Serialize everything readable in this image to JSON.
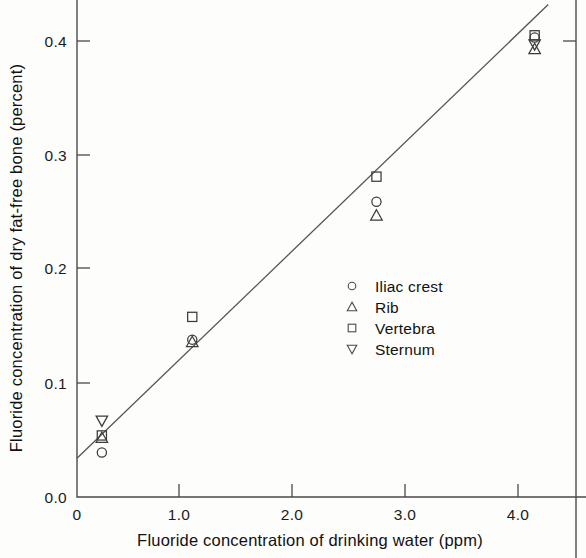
{
  "chart_data": {
    "type": "scatter",
    "title": "",
    "xlabel": "Fluoride concentration of drinking water (ppm)",
    "ylabel": "Fluoride concentration of dry fat-free bone (percent)",
    "xlim": [
      0.0,
      4.4
    ],
    "ylim": [
      0.0,
      0.44
    ],
    "xticks": [
      0,
      1.0,
      2.0,
      3.0,
      4.0
    ],
    "xtick_labels": [
      "0",
      "1.0",
      "2.0",
      "3.0",
      "4.0"
    ],
    "yticks": [
      0.0,
      0.1,
      0.2,
      0.3,
      0.4
    ],
    "ytick_labels": [
      "0.0",
      "0.1",
      "0.2",
      "0.3",
      "0.4"
    ],
    "grid": false,
    "legend_position": "center-right",
    "series": [
      {
        "name": "Iliac crest",
        "marker": "circle",
        "points": [
          {
            "x": 0.22,
            "y": 0.039
          },
          {
            "x": 1.02,
            "y": 0.138
          },
          {
            "x": 2.65,
            "y": 0.259
          },
          {
            "x": 4.05,
            "y": 0.403
          }
        ]
      },
      {
        "name": "Rib",
        "marker": "triangle-up",
        "points": [
          {
            "x": 0.22,
            "y": 0.052
          },
          {
            "x": 1.02,
            "y": 0.136
          },
          {
            "x": 2.65,
            "y": 0.247
          },
          {
            "x": 4.05,
            "y": 0.393
          }
        ]
      },
      {
        "name": "Vertebra",
        "marker": "square",
        "points": [
          {
            "x": 0.22,
            "y": 0.054
          },
          {
            "x": 1.02,
            "y": 0.158
          },
          {
            "x": 2.65,
            "y": 0.281
          },
          {
            "x": 4.05,
            "y": 0.405
          }
        ]
      },
      {
        "name": "Sternum",
        "marker": "triangle-down",
        "points": [
          {
            "x": 0.22,
            "y": 0.067
          },
          {
            "x": 4.05,
            "y": 0.397
          }
        ]
      }
    ],
    "fit_line": {
      "x_start": 0.0,
      "y_start": 0.034,
      "x_end": 4.17,
      "y_end": 0.432
    },
    "colors": {
      "marker_stroke": "#3b3b3b",
      "axis": "#4a4a4a",
      "fit_line": "#555555",
      "text": "#111111",
      "background": "#fdfdfc"
    }
  },
  "legend": {
    "items": [
      {
        "label": "Iliac crest",
        "marker": "circle"
      },
      {
        "label": "Rib",
        "marker": "triangle-up"
      },
      {
        "label": "Vertebra",
        "marker": "square"
      },
      {
        "label": "Sternum",
        "marker": "triangle-down"
      }
    ]
  }
}
